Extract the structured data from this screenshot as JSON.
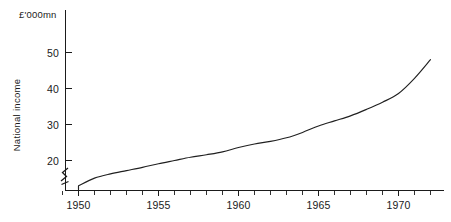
{
  "chart_data": {
    "type": "line",
    "title": "",
    "subtitle": "",
    "unit_label": "£'000mn",
    "xlabel": "",
    "ylabel": "National income",
    "xlim": [
      1949,
      1972
    ],
    "ylim": [
      12,
      55
    ],
    "grid": false,
    "legend": null,
    "y_axis_break": true,
    "y_axis_break_note": "axis broken below 20",
    "x_tick_labels": [
      "1950",
      "1955",
      "1960",
      "1965",
      "1970"
    ],
    "x_tick_values": [
      1950,
      1955,
      1960,
      1965,
      1970
    ],
    "x_minor_tick_values": [
      1949,
      1951,
      1952,
      1953,
      1954,
      1956,
      1957,
      1958,
      1959,
      1961,
      1962,
      1963,
      1964,
      1966,
      1967,
      1968,
      1969,
      1971,
      1972
    ],
    "y_tick_labels": [
      "20",
      "30",
      "40",
      "50"
    ],
    "y_tick_values": [
      20,
      30,
      40,
      50
    ],
    "series": [
      {
        "name": "National income",
        "x": [
          1950,
          1951,
          1952,
          1953,
          1954,
          1955,
          1956,
          1957,
          1958,
          1959,
          1960,
          1961,
          1962,
          1963,
          1964,
          1965,
          1966,
          1967,
          1968,
          1969,
          1970,
          1971,
          1972
        ],
        "values": [
          13.0,
          15.1,
          16.3,
          17.2,
          18.1,
          19.1,
          20.0,
          20.9,
          21.6,
          22.4,
          23.6,
          24.6,
          25.3,
          26.3,
          27.8,
          29.6,
          31.0,
          32.4,
          34.2,
          36.2,
          38.6,
          42.8,
          48.0
        ]
      }
    ]
  },
  "axis": {
    "unit_caption": "£'000mn",
    "y_title": "National income"
  }
}
